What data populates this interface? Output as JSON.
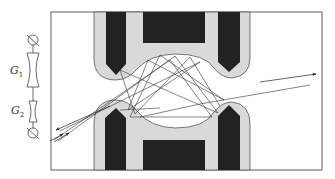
{
  "figure": {
    "labels": {
      "g1": "G",
      "g1_sub": "1",
      "g2": "G",
      "g2_sub": "2"
    },
    "colors": {
      "electrode_fill": "#222222",
      "insulator_fill": "#d9d9d9",
      "outline": "#555555",
      "ray": "#333333",
      "frame": "#777777",
      "background": "#ffffff"
    },
    "components": {
      "circuit": [
        "source-top",
        "lens-G1",
        "lens-G2",
        "source-bottom"
      ],
      "trap": [
        "top-electrode-assembly",
        "bottom-electrode-assembly"
      ],
      "rays": "multiple reflected trajectories with arrowheads at entry/exit"
    }
  }
}
